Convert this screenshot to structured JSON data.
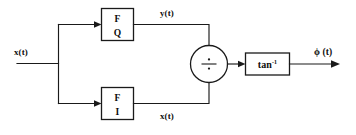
{
  "diagram": {
    "background_color": "#ffffff",
    "line_color": "#1a1a1a",
    "input": {
      "label": "x(t)"
    },
    "blocks": [
      {
        "id": "filter-q",
        "line1": "F",
        "line2": "Q",
        "output_label": "y(t)"
      },
      {
        "id": "filter-i",
        "line1": "F",
        "line2": "I",
        "output_label": "x(t)"
      }
    ],
    "junction": {
      "operator": "divide",
      "symbol": "÷"
    },
    "arctan_block": {
      "base": "tan",
      "exponent": "-1"
    },
    "output": {
      "label": "ϕ (t)"
    }
  }
}
